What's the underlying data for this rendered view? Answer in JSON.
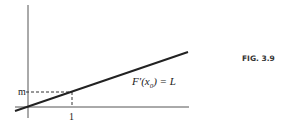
{
  "figure": {
    "caption": "FIG. 3.9",
    "labels": {
      "y_tick": "m",
      "x_tick": "1",
      "line_label_prefix": "F′(x",
      "line_label_sub": "0",
      "line_label_suffix": ") = L"
    },
    "colors": {
      "ink": "#222222",
      "axis": "#555555",
      "background": "#ffffff"
    }
  }
}
